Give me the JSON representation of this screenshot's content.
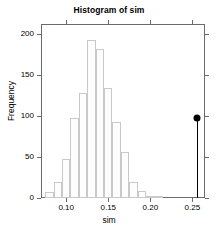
{
  "chart_data": {
    "type": "bar",
    "title": "Histogram of sim",
    "xlabel": "sim",
    "ylabel": "Frequency",
    "xlim": [
      0.07,
      0.265
    ],
    "ylim": [
      0,
      212
    ],
    "grid": false,
    "legend": null,
    "bin_width": 0.01,
    "bin_edges": [
      0.075,
      0.085,
      0.095,
      0.105,
      0.115,
      0.125,
      0.135,
      0.145,
      0.155,
      0.165,
      0.175,
      0.185,
      0.195,
      0.205,
      0.215
    ],
    "categories": [
      "0.075-0.085",
      "0.085-0.095",
      "0.095-0.105",
      "0.105-0.115",
      "0.115-0.125",
      "0.125-0.135",
      "0.135-0.145",
      "0.145-0.155",
      "0.155-0.165",
      "0.165-0.175",
      "0.175-0.185",
      "0.185-0.195",
      "0.195-0.205",
      "0.205-0.215"
    ],
    "values": [
      7,
      19,
      47,
      98,
      128,
      193,
      182,
      134,
      93,
      56,
      19,
      8,
      1,
      1
    ],
    "xticks": [
      {
        "value": 0.1,
        "label": "0.10"
      },
      {
        "value": 0.15,
        "label": "0.15"
      },
      {
        "value": 0.2,
        "label": "0.20"
      },
      {
        "value": 0.25,
        "label": "0.25"
      }
    ],
    "yticks": [
      {
        "value": 0,
        "label": "0"
      },
      {
        "value": 50,
        "label": "50"
      },
      {
        "value": 100,
        "label": "100"
      },
      {
        "value": 150,
        "label": "150"
      },
      {
        "value": 200,
        "label": "200"
      }
    ],
    "annotations": [
      {
        "name": "observed-value-marker",
        "type": "lollipop",
        "x": 0.256,
        "y": 97,
        "color": "#000000"
      }
    ],
    "colors": {
      "bar_fill": "#fdfdfd",
      "bar_border": "#c9c9c9",
      "axis": "#6b6b6b",
      "marker": "#000000",
      "background": "#ffffff"
    }
  }
}
